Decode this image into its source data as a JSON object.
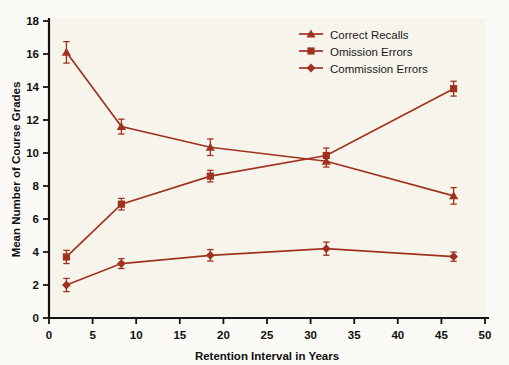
{
  "chart_data": {
    "type": "line",
    "title": "",
    "xlabel": "Retention Interval in Years",
    "ylabel": "Mean Number of Course Grades",
    "xlim": [
      0,
      50
    ],
    "ylim": [
      0,
      18
    ],
    "xticks": [
      0,
      5,
      10,
      15,
      20,
      25,
      30,
      35,
      40,
      45,
      50
    ],
    "yticks": [
      0,
      2,
      4,
      6,
      8,
      10,
      12,
      14,
      16,
      18
    ],
    "grid": false,
    "legend_position": "top-right",
    "x": [
      2.0,
      8.3,
      18.5,
      31.8,
      46.4
    ],
    "series": [
      {
        "name": "Correct Recalls",
        "marker": "triangle",
        "color": "#A0331F",
        "values": [
          16.1,
          11.6,
          10.35,
          9.5,
          7.4
        ],
        "errors": [
          0.65,
          0.45,
          0.5,
          0.35,
          0.5
        ]
      },
      {
        "name": "Omission Errors",
        "marker": "square",
        "color": "#A0331F",
        "values": [
          3.7,
          6.9,
          8.6,
          9.85,
          13.9
        ],
        "errors": [
          0.4,
          0.35,
          0.35,
          0.45,
          0.45
        ]
      },
      {
        "name": "Commission Errors",
        "marker": "diamond",
        "color": "#A0331F",
        "values": [
          2.0,
          3.3,
          3.8,
          4.2,
          3.72
        ],
        "errors": [
          0.4,
          0.3,
          0.35,
          0.4,
          0.28
        ]
      }
    ]
  },
  "legend": {
    "items": [
      {
        "label": "Correct Recalls"
      },
      {
        "label": "Omission Errors"
      },
      {
        "label": "Commission Errors"
      }
    ]
  },
  "colors": {
    "series": "#A0331F",
    "axis": "#141414",
    "plot_background": "#f7f4ec",
    "page_background": "#fbfaf6"
  }
}
